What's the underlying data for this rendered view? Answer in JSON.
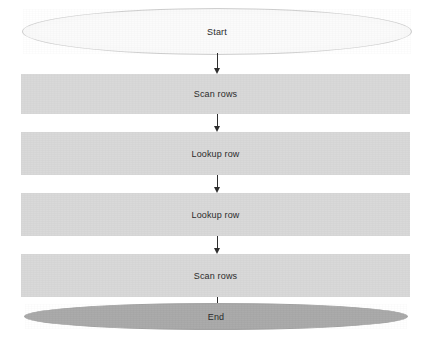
{
  "diagram": {
    "type": "flowchart",
    "orientation": "top-to-bottom",
    "colors": {
      "background": "#ffffff",
      "process_fill": "#d8d8d8",
      "start_fill": "#fbfbfb",
      "start_stroke": "#cfcfcf",
      "end_fill": "#a9a9a9",
      "text": "#2b2b2b",
      "connector": "#2e2e2e"
    },
    "nodes": [
      {
        "id": "start",
        "label": "Start",
        "shape": "ellipse",
        "role": "terminator"
      },
      {
        "id": "step1",
        "label": "Scan rows",
        "shape": "rectangle",
        "role": "process"
      },
      {
        "id": "step2",
        "label": "Lookup row",
        "shape": "rectangle",
        "role": "process"
      },
      {
        "id": "step3",
        "label": "Lookup row",
        "shape": "rectangle",
        "role": "process"
      },
      {
        "id": "step4",
        "label": "Scan rows",
        "shape": "rectangle",
        "role": "process"
      },
      {
        "id": "end",
        "label": "End",
        "shape": "ellipse",
        "role": "terminator"
      }
    ],
    "edges": [
      {
        "from": "start",
        "to": "step1",
        "style": "arrow"
      },
      {
        "from": "step1",
        "to": "step2",
        "style": "arrow"
      },
      {
        "from": "step2",
        "to": "step3",
        "style": "arrow"
      },
      {
        "from": "step3",
        "to": "step4",
        "style": "arrow"
      },
      {
        "from": "step4",
        "to": "end",
        "style": "arrow"
      }
    ]
  }
}
